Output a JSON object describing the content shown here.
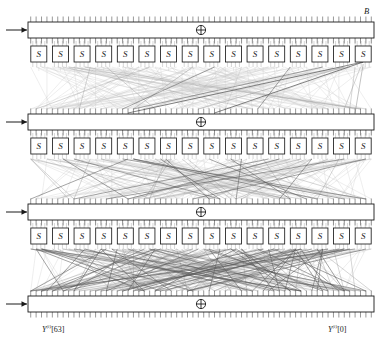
{
  "figure": {
    "type": "block-cipher-network"
  },
  "labels": {
    "block_input": "B",
    "keys": [
      {
        "base": "K",
        "sup": "7"
      },
      {
        "base": "K",
        "sup": "8"
      },
      {
        "base": "K",
        "sup": "9"
      },
      {
        "base": "K",
        "sup": "10"
      }
    ],
    "outputs": [
      {
        "base": "Y",
        "sup": "(i)",
        "index": "[63]"
      },
      {
        "base": "Y",
        "sup": "(i)",
        "index": "[0]"
      }
    ],
    "sbox": "S",
    "xor": "⊕"
  },
  "geometry": {
    "width": 383,
    "height": 352,
    "bar_left": 28,
    "bar_right": 374,
    "bar_height": 16,
    "bar_tops": [
      22,
      114,
      204,
      296
    ],
    "sbox_row_tops": [
      46,
      138,
      228
    ],
    "sbox_count": 16,
    "sbox_size": 16,
    "bits": 64
  },
  "colors": {
    "ink": "#1a1a1a",
    "wire_light": "#c8c8c8",
    "wire_mid": "#9a9a9a",
    "wire_dark": "#5a5a5a",
    "box_fill": "#ffffff",
    "background": "#ffffff"
  },
  "counts": {
    "rounds": 4,
    "sbox_layers": 3,
    "sboxes_per_layer": 16,
    "total_sboxes": 48
  }
}
